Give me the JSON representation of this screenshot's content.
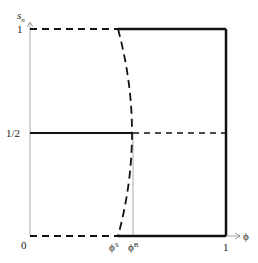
{
  "diagram": {
    "type": "phase-diagram",
    "y_axis": {
      "label": "s",
      "label_sub": "n",
      "ticks": [
        "0",
        "1/2",
        "1"
      ]
    },
    "x_axis": {
      "label": "ϕ",
      "ticks": [
        "0",
        "1"
      ]
    },
    "markers": [
      {
        "symbol": "ϕ",
        "sup": "S"
      },
      {
        "symbol": "ϕ",
        "sup": "B"
      }
    ],
    "colors": {
      "line": "#111111",
      "axis": "#aaaaaa"
    }
  }
}
